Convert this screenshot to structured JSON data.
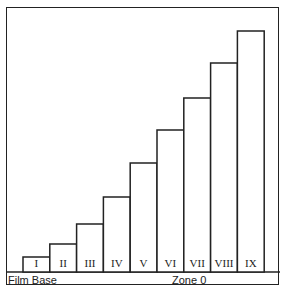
{
  "chart_data": {
    "type": "bar",
    "title": "",
    "categories": [
      "I",
      "II",
      "III",
      "IV",
      "V",
      "VI",
      "VII",
      "VIII",
      "IX"
    ],
    "values": [
      15,
      28,
      48,
      75,
      109,
      142,
      174,
      209,
      241
    ],
    "value_unit": "relative density (arbitrary)",
    "ylim": [
      0,
      255
    ],
    "base_labels": {
      "left": "Film Base",
      "center": "Zone 0"
    }
  }
}
